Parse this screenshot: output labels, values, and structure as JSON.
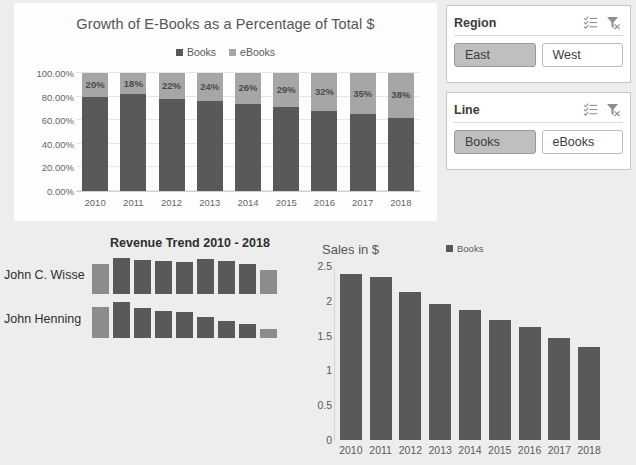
{
  "colors": {
    "books": "#595959",
    "ebooks": "#a6a6a6",
    "spark_dark": "#595959",
    "spark_light": "#8c8c8c",
    "panel_bg": "#fdfdfd",
    "page_bg": "#ededed",
    "slicer_selected": "#bfbfbf"
  },
  "slicers": [
    {
      "name": "region",
      "title": "Region",
      "multiselect_icon": "multi-select-icon",
      "clear_filter_icon": "clear-filter-icon",
      "items": [
        {
          "label": "East",
          "selected": true
        },
        {
          "label": "West",
          "selected": false
        }
      ]
    },
    {
      "name": "line",
      "title": "Line",
      "multiselect_icon": "multi-select-icon",
      "clear_filter_icon": "clear-filter-icon",
      "items": [
        {
          "label": "Books",
          "selected": true
        },
        {
          "label": "eBooks",
          "selected": false
        }
      ]
    }
  ],
  "chart_data": [
    {
      "type": "bar",
      "id": "stacked_percent",
      "title": "Growth of E-Books as a Percentage of Total $",
      "subtitle": "",
      "xlabel": "",
      "ylabel": "",
      "stacked": true,
      "percent_stacked": true,
      "grid": true,
      "legend_position": "top",
      "legend": [
        "Books",
        "eBooks"
      ],
      "categories": [
        "2010",
        "2011",
        "2012",
        "2013",
        "2014",
        "2015",
        "2016",
        "2017",
        "2018"
      ],
      "ylim": [
        0,
        100
      ],
      "ytick_labels": [
        "0.00%",
        "20.00%",
        "40.00%",
        "60.00%",
        "80.00%",
        "100.00%"
      ],
      "ytick_values": [
        0,
        20,
        40,
        60,
        80,
        100
      ],
      "series": [
        {
          "name": "Books",
          "values": [
            80,
            82,
            78,
            76,
            74,
            71,
            68,
            65,
            62
          ]
        },
        {
          "name": "eBooks",
          "values": [
            20,
            18,
            22,
            24,
            26,
            29,
            32,
            35,
            38
          ]
        }
      ],
      "data_labels": [
        "20%",
        "18%",
        "22%",
        "24%",
        "26%",
        "29%",
        "32%",
        "35%",
        "38%"
      ]
    },
    {
      "type": "bar",
      "id": "revenue_sparklines",
      "title": "Revenue Trend 2010 - 2018",
      "grid": false,
      "legend_position": "none",
      "categories": [
        "2010",
        "2011",
        "2012",
        "2013",
        "2014",
        "2015",
        "2016",
        "2017",
        "2018"
      ],
      "row_labels": [
        "John C. Wisse",
        "John Henning"
      ],
      "series": [
        {
          "name": "John C. Wisse",
          "values": [
            82,
            100,
            94,
            92,
            90,
            96,
            92,
            82,
            66
          ]
        },
        {
          "name": "John Henning",
          "values": [
            86,
            100,
            82,
            74,
            72,
            58,
            48,
            38,
            26
          ]
        }
      ]
    },
    {
      "type": "bar",
      "id": "sales_in_dollars",
      "title": "Sales in $",
      "xlabel": "",
      "ylabel": "Sales in $",
      "grid": false,
      "legend_position": "top-right",
      "legend": [
        "Books"
      ],
      "categories": [
        "2010",
        "2011",
        "2012",
        "2013",
        "2014",
        "2015",
        "2016",
        "2017",
        "2018"
      ],
      "ylim": [
        0,
        2.5
      ],
      "ytick_labels": [
        "0",
        "0.5",
        "1",
        "1.5",
        "2",
        "2.5"
      ],
      "ytick_values": [
        0,
        0.5,
        1,
        1.5,
        2,
        2.5
      ],
      "values": [
        2.38,
        2.34,
        2.13,
        1.96,
        1.87,
        1.72,
        1.62,
        1.46,
        1.33
      ]
    }
  ]
}
